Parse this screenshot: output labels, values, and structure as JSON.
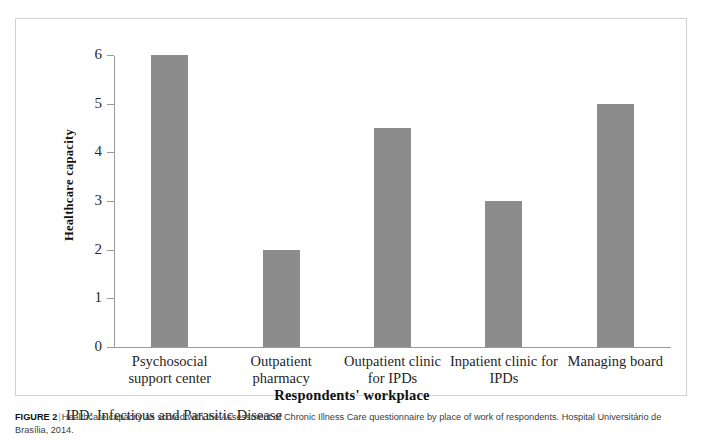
{
  "figure": {
    "caption_label": "FIGURE 2",
    "caption_divider": "|",
    "caption_text": "Healthcare capacity as scored with the Assessment of Chronic Illness Care questionnaire by place of work of respondents. Hospital Universitário de Brasília, 2014.",
    "footnote": "IPD: Infectious  and Parasitic  Disease"
  },
  "chart_data": {
    "type": "bar",
    "title": "",
    "xlabel": "Respondents' workplace",
    "ylabel": "Healthcare capacity",
    "categories": [
      "Psychosocial support center",
      "Outpatient pharmacy",
      "Outpatient clinic for IPDs",
      "Inpatient clinic for IPDs",
      "Managing board"
    ],
    "values": [
      6,
      2,
      4.5,
      3,
      5
    ],
    "ylim": [
      0,
      6
    ],
    "yticks": [
      0,
      1,
      2,
      3,
      4,
      5,
      6
    ],
    "ytick_labels": [
      "0",
      "1",
      "2",
      "3",
      "4",
      "5",
      "6"
    ],
    "grid": false,
    "legend": false,
    "bar_color": "#8c8c8c",
    "axis_color": "#9a9a9a"
  }
}
